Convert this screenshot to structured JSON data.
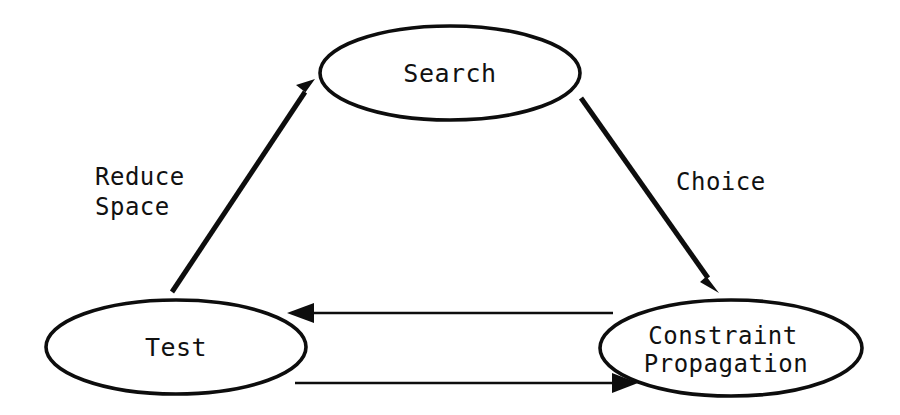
{
  "diagram": {
    "background_color": "#ffffff",
    "stroke_color": "#0d0d0d",
    "text_color": "#111111",
    "nodes": [
      {
        "id": "search",
        "label": "Search",
        "lines": [
          "Search"
        ],
        "shape": "ellipse",
        "cx": 450,
        "cy": 73,
        "rx": 130,
        "ry": 47
      },
      {
        "id": "test",
        "label": "Test",
        "lines": [
          "Test"
        ],
        "shape": "ellipse",
        "cx": 176,
        "cy": 347,
        "rx": 130,
        "ry": 47
      },
      {
        "id": "constraint-propagation",
        "label": "Constraint Propagation",
        "lines": [
          "Constraint",
          "Propagation"
        ],
        "shape": "ellipse",
        "cx": 731,
        "cy": 348,
        "rx": 131,
        "ry": 48
      }
    ],
    "edges": [
      {
        "id": "test-to-search",
        "from": "test",
        "to": "search",
        "label": "Reduce Space",
        "label_lines": [
          "Reduce",
          "Space"
        ],
        "direction": "up-right",
        "thickness": 5
      },
      {
        "id": "search-to-constraint",
        "from": "search",
        "to": "constraint-propagation",
        "label": "Choice",
        "label_lines": [
          "Choice"
        ],
        "direction": "down-right",
        "thickness": 5
      },
      {
        "id": "constraint-to-test",
        "from": "constraint-propagation",
        "to": "test",
        "label": "",
        "label_lines": [],
        "direction": "left",
        "thickness": 2
      },
      {
        "id": "test-to-constraint",
        "from": "test",
        "to": "constraint-propagation",
        "label": "",
        "label_lines": [],
        "direction": "right",
        "thickness": 2
      }
    ]
  }
}
